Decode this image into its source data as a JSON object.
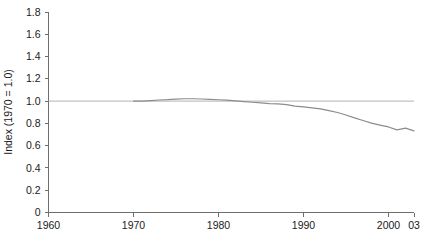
{
  "chart_data": {
    "type": "line",
    "title": "",
    "xlabel": "",
    "ylabel": "Index (1970 = 1.0)",
    "xlim": [
      1960,
      2003
    ],
    "ylim": [
      0,
      1.8
    ],
    "grid": false,
    "legend": null,
    "y_ticks": [
      "0",
      "0.2",
      "0.4",
      "0.6",
      "0.8",
      "1.0",
      "1.2",
      "1.4",
      "1.6",
      "1.8"
    ],
    "y_tick_values": [
      0,
      0.2,
      0.4,
      0.6,
      0.8,
      1.0,
      1.2,
      1.4,
      1.6,
      1.8
    ],
    "x_ticks": [
      "1960",
      "1970",
      "1980",
      "1990",
      "2000",
      "03"
    ],
    "x_tick_values": [
      1960,
      1970,
      1980,
      1990,
      2000,
      2003
    ],
    "reference_line": {
      "label": "1.0 baseline",
      "value": 1.0,
      "color": "#b3b3b3",
      "x_start": 1960,
      "x_end": 2003
    },
    "series": [
      {
        "name": "Index",
        "color": "#8c8c8c",
        "x": [
          1970,
          1971,
          1972,
          1973,
          1974,
          1975,
          1976,
          1977,
          1978,
          1979,
          1980,
          1981,
          1982,
          1983,
          1984,
          1985,
          1986,
          1987,
          1988,
          1989,
          1990,
          1991,
          1992,
          1993,
          1994,
          1995,
          1996,
          1997,
          1998,
          1999,
          2000,
          2001,
          2002,
          2003
        ],
        "values": [
          1.0,
          1.0,
          1.005,
          1.01,
          1.013,
          1.018,
          1.021,
          1.021,
          1.019,
          1.016,
          1.012,
          1.008,
          1.002,
          0.996,
          0.99,
          0.985,
          0.978,
          0.975,
          0.968,
          0.955,
          0.948,
          0.94,
          0.93,
          0.915,
          0.898,
          0.875,
          0.85,
          0.826,
          0.802,
          0.785,
          0.768,
          0.742,
          0.757,
          0.733
        ]
      }
    ]
  },
  "footer": {
    "cropped_text": ""
  }
}
